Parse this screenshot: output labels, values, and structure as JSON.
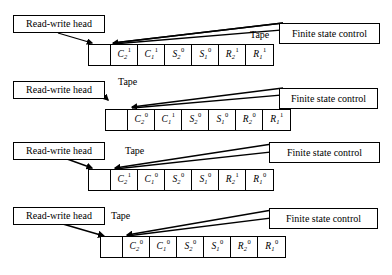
{
  "figure": {
    "labels": {
      "head": "Read-write head",
      "tape": "Tape",
      "control": "Finite state control"
    },
    "colors": {
      "ink": "#000000",
      "paper": "#ffffff"
    }
  },
  "rows": [
    {
      "id": "row-1",
      "head_label": "Read-write head",
      "tape_label": "Tape",
      "control_label": "Finite state control",
      "cells": [
        {
          "base": "",
          "sub": "",
          "sup": "",
          "blank": true
        },
        {
          "base": "C",
          "sub": "2",
          "sup": "1",
          "blank": false
        },
        {
          "base": "C",
          "sub": "1",
          "sup": "1",
          "blank": false
        },
        {
          "base": "S",
          "sub": "2",
          "sup": "0",
          "blank": false
        },
        {
          "base": "S",
          "sub": "1",
          "sup": "0",
          "blank": false
        },
        {
          "base": "R",
          "sub": "2",
          "sup": "1",
          "blank": false
        },
        {
          "base": "R",
          "sub": "1",
          "sup": "1",
          "blank": false
        }
      ]
    },
    {
      "id": "row-2",
      "head_label": "Read-write head",
      "tape_label": "Tape",
      "control_label": "Finite state control",
      "cells": [
        {
          "base": "",
          "sub": "",
          "sup": "",
          "blank": true
        },
        {
          "base": "C",
          "sub": "2",
          "sup": "0",
          "blank": false
        },
        {
          "base": "C",
          "sub": "1",
          "sup": "1",
          "blank": false
        },
        {
          "base": "S",
          "sub": "2",
          "sup": "0",
          "blank": false
        },
        {
          "base": "S",
          "sub": "1",
          "sup": "0",
          "blank": false
        },
        {
          "base": "R",
          "sub": "2",
          "sup": "0",
          "blank": false
        },
        {
          "base": "R",
          "sub": "1",
          "sup": "1",
          "blank": false
        }
      ]
    },
    {
      "id": "row-3",
      "head_label": "Read-write head",
      "tape_label": "Tape",
      "control_label": "Finite state control",
      "cells": [
        {
          "base": "",
          "sub": "",
          "sup": "",
          "blank": true
        },
        {
          "base": "C",
          "sub": "2",
          "sup": "1",
          "blank": false
        },
        {
          "base": "C",
          "sub": "1",
          "sup": "0",
          "blank": false
        },
        {
          "base": "S",
          "sub": "2",
          "sup": "0",
          "blank": false
        },
        {
          "base": "S",
          "sub": "1",
          "sup": "0",
          "blank": false
        },
        {
          "base": "R",
          "sub": "2",
          "sup": "1",
          "blank": false
        },
        {
          "base": "R",
          "sub": "1",
          "sup": "0",
          "blank": false
        }
      ]
    },
    {
      "id": "row-4",
      "head_label": "Read-write head",
      "tape_label": "Tape",
      "control_label": "Finite state control",
      "cells": [
        {
          "base": "",
          "sub": "",
          "sup": "",
          "blank": true
        },
        {
          "base": "C",
          "sub": "2",
          "sup": "0",
          "blank": false
        },
        {
          "base": "C",
          "sub": "1",
          "sup": "0",
          "blank": false
        },
        {
          "base": "S",
          "sub": "2",
          "sup": "0",
          "blank": false
        },
        {
          "base": "S",
          "sub": "1",
          "sup": "0",
          "blank": false
        },
        {
          "base": "R",
          "sub": "2",
          "sup": "0",
          "blank": false
        },
        {
          "base": "R",
          "sub": "1",
          "sup": "0",
          "blank": false
        }
      ]
    }
  ]
}
